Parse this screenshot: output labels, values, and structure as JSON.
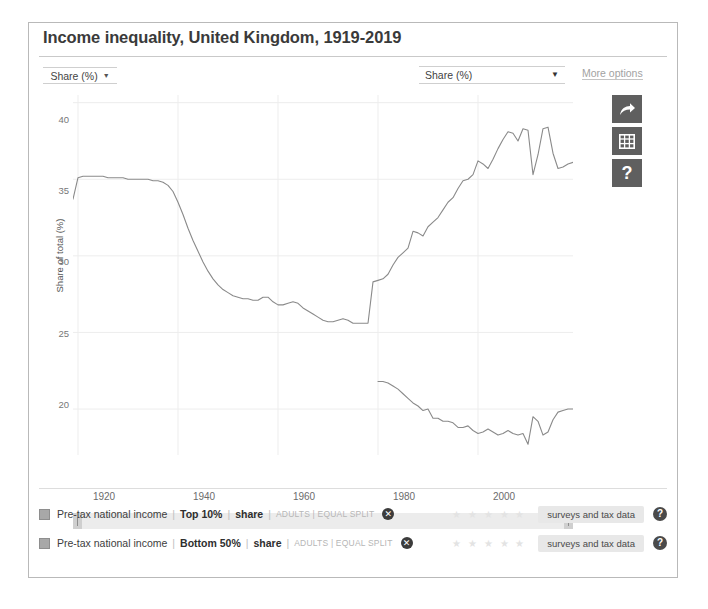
{
  "card": {
    "title": "Income inequality, United Kingdom, 1919-2019"
  },
  "controls": {
    "left_select": {
      "value": "Share (%)",
      "caret": "▼"
    },
    "right_select": {
      "value": "Share (%)",
      "caret": "▼"
    },
    "more_options": "More options"
  },
  "icon_buttons": [
    {
      "name": "share-icon",
      "glyph": "arrow-curve-right"
    },
    {
      "name": "table-icon",
      "glyph": "grid"
    },
    {
      "name": "help-icon",
      "glyph": "?"
    }
  ],
  "legend": {
    "rows": [
      {
        "source": "Pre-tax national income",
        "metric": "Top 10%",
        "measure": "share",
        "meta": "ADULTS | EQUAL SPLIT",
        "close": "✕",
        "stars": "★ ★ ★ ★ ★",
        "pill": "surveys and tax data",
        "help": "?"
      },
      {
        "source": "Pre-tax national income",
        "metric": "Bottom 50%",
        "measure": "share",
        "meta": "ADULTS | EQUAL SPLIT",
        "close": "✕",
        "stars": "★ ★ ★ ★ ★",
        "pill": "surveys and tax data",
        "help": "?"
      }
    ]
  },
  "chart_data": {
    "type": "line",
    "title": "Income inequality, United Kingdom, 1919-2019",
    "xlabel": "",
    "ylabel": "Share of total (%)",
    "xlim": [
      1919,
      2019
    ],
    "ylim": [
      17.0,
      40.5
    ],
    "xticks": [
      1920,
      1940,
      1960,
      1980,
      2000
    ],
    "yticks": [
      20,
      25,
      30,
      35,
      40
    ],
    "grid": true,
    "legend_position": "bottom",
    "line_color": "#8a8a8a",
    "series": [
      {
        "name": "Pre-tax national income | Top 10% | share",
        "x": [
          1919,
          1920,
          1921,
          1922,
          1923,
          1924,
          1925,
          1926,
          1927,
          1928,
          1929,
          1930,
          1931,
          1932,
          1933,
          1934,
          1935,
          1936,
          1937,
          1938,
          1939,
          1940,
          1941,
          1942,
          1943,
          1944,
          1945,
          1946,
          1947,
          1948,
          1949,
          1950,
          1951,
          1952,
          1953,
          1954,
          1955,
          1956,
          1957,
          1958,
          1959,
          1960,
          1961,
          1962,
          1963,
          1964,
          1965,
          1966,
          1967,
          1968,
          1969,
          1970,
          1971,
          1972,
          1973,
          1974,
          1975,
          1976,
          1977,
          1978,
          1979,
          1980,
          1981,
          1982,
          1983,
          1984,
          1985,
          1986,
          1987,
          1988,
          1989,
          1990,
          1991,
          1992,
          1993,
          1994,
          1995,
          1996,
          1997,
          1998,
          1999,
          2000,
          2001,
          2002,
          2003,
          2004,
          2005,
          2006,
          2007,
          2008,
          2009,
          2010,
          2011,
          2012,
          2013,
          2014,
          2015,
          2016,
          2017,
          2018,
          2019
        ],
        "values": [
          33.7,
          35.1,
          35.2,
          35.2,
          35.2,
          35.2,
          35.2,
          35.1,
          35.1,
          35.1,
          35.1,
          35.0,
          35.0,
          35.0,
          35.0,
          35.0,
          34.9,
          34.9,
          34.8,
          34.6,
          34.2,
          33.5,
          32.7,
          31.8,
          31.0,
          30.3,
          29.6,
          29.0,
          28.5,
          28.1,
          27.8,
          27.6,
          27.4,
          27.3,
          27.2,
          27.2,
          27.1,
          27.1,
          27.3,
          27.3,
          27.0,
          26.8,
          26.8,
          26.9,
          27.0,
          26.9,
          26.6,
          26.4,
          26.2,
          26.0,
          25.8,
          25.7,
          25.7,
          25.8,
          25.9,
          25.8,
          25.6,
          25.6,
          25.6,
          25.6,
          28.3,
          28.4,
          28.5,
          28.8,
          29.4,
          29.9,
          30.2,
          30.5,
          31.6,
          31.5,
          31.3,
          31.9,
          32.2,
          32.5,
          33.0,
          33.5,
          33.8,
          34.4,
          34.9,
          35.0,
          35.3,
          36.2,
          36.0,
          35.7,
          36.3,
          37.0,
          37.6,
          38.1,
          38.0,
          37.5,
          38.3,
          38.2,
          35.3,
          36.6,
          38.3,
          38.4,
          36.7,
          35.7,
          35.8,
          36.0,
          36.1
        ]
      },
      {
        "name": "Pre-tax national income | Bottom 50% | share",
        "x": [
          1980,
          1981,
          1982,
          1983,
          1984,
          1985,
          1986,
          1987,
          1988,
          1989,
          1990,
          1991,
          1992,
          1993,
          1994,
          1995,
          1996,
          1997,
          1998,
          1999,
          2000,
          2001,
          2002,
          2003,
          2004,
          2005,
          2006,
          2007,
          2008,
          2009,
          2010,
          2011,
          2012,
          2013,
          2014,
          2015,
          2016,
          2017,
          2018,
          2019
        ],
        "values": [
          21.8,
          21.8,
          21.7,
          21.5,
          21.3,
          21.0,
          20.7,
          20.4,
          20.2,
          19.9,
          20.0,
          19.4,
          19.4,
          19.2,
          19.2,
          19.1,
          18.8,
          18.8,
          18.9,
          18.6,
          18.4,
          18.5,
          18.7,
          18.5,
          18.3,
          18.4,
          18.6,
          18.4,
          18.3,
          18.4,
          17.7,
          19.5,
          19.2,
          18.3,
          18.5,
          19.3,
          19.8,
          19.9,
          20.0,
          20.0
        ]
      }
    ]
  }
}
